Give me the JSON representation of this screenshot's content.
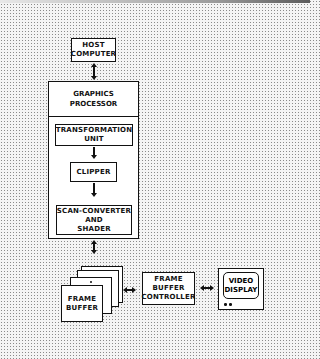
{
  "diagram": {
    "type": "block-diagram",
    "nodes": {
      "host_computer": {
        "lines": [
          "HOST",
          "COMPUTER"
        ]
      },
      "graphics_processor": {
        "lines": [
          "GRAPHICS",
          "PROCESSOR"
        ]
      },
      "transformation_unit": {
        "lines": [
          "TRANSFORMATION",
          "UNIT"
        ]
      },
      "clipper": {
        "lines": [
          "CLIPPER"
        ]
      },
      "scan_converter": {
        "lines": [
          "SCAN-CONVERTER",
          "AND",
          "SHADER"
        ]
      },
      "frame_buffer": {
        "lines": [
          "FRAME",
          "BUFFER"
        ]
      },
      "frame_buffer_controller": {
        "lines": [
          "FRAME",
          "BUFFER",
          "CONTROLLER"
        ]
      },
      "video_display": {
        "lines": [
          "VIDEO",
          "DISPLAY"
        ]
      }
    },
    "edges": [
      {
        "from": "host_computer",
        "to": "graphics_processor",
        "direction": "bidirectional"
      },
      {
        "from": "transformation_unit",
        "to": "clipper",
        "direction": "forward"
      },
      {
        "from": "clipper",
        "to": "scan_converter",
        "direction": "forward"
      },
      {
        "from": "graphics_processor",
        "to": "frame_buffer",
        "direction": "bidirectional"
      },
      {
        "from": "frame_buffer",
        "to": "frame_buffer_controller",
        "direction": "bidirectional"
      },
      {
        "from": "frame_buffer_controller",
        "to": "video_display",
        "direction": "bidirectional"
      }
    ],
    "colors": {
      "line": "#111111",
      "box_fill": "#ffffff",
      "background_dots": "#8a8a8a"
    }
  }
}
